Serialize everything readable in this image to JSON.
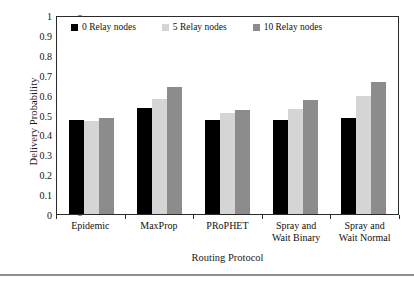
{
  "chart_data": {
    "type": "bar",
    "title": "",
    "xlabel": "Routing Protocol",
    "ylabel": "Delivery Probability",
    "categories": [
      "Epidemic",
      "MaxProp",
      "PRoPHET",
      "Spray and Wait Binary",
      "Spray and Wait Normal"
    ],
    "category_lines": [
      [
        "Epidemic"
      ],
      [
        "MaxProp"
      ],
      [
        "PRoPHET"
      ],
      [
        "Spray and",
        "Wait Binary"
      ],
      [
        "Spray and",
        "Wait Normal"
      ]
    ],
    "series": [
      {
        "name": "0 Relay nodes",
        "color": "#000000",
        "values": [
          0.47,
          0.535,
          0.47,
          0.47,
          0.485
        ]
      },
      {
        "name": "5 Relay nodes",
        "color": "#d5d5d5",
        "values": [
          0.465,
          0.58,
          0.51,
          0.53,
          0.595
        ]
      },
      {
        "name": "10 Relay nodes",
        "color": "#8c8c8c",
        "values": [
          0.485,
          0.64,
          0.525,
          0.575,
          0.665
        ]
      }
    ],
    "ylim": [
      0,
      1
    ],
    "ytick_labels": [
      "0",
      "0.1",
      "0.2",
      "0.3",
      "0.4",
      "0.5",
      "0.6",
      "0.7",
      "0.8",
      "0.9",
      "1"
    ],
    "ytick_values": [
      0,
      0.1,
      0.2,
      0.3,
      0.4,
      0.5,
      0.6,
      0.7,
      0.8,
      0.9,
      1
    ],
    "grid": false,
    "legend_position": "top-inside",
    "frame": true
  }
}
